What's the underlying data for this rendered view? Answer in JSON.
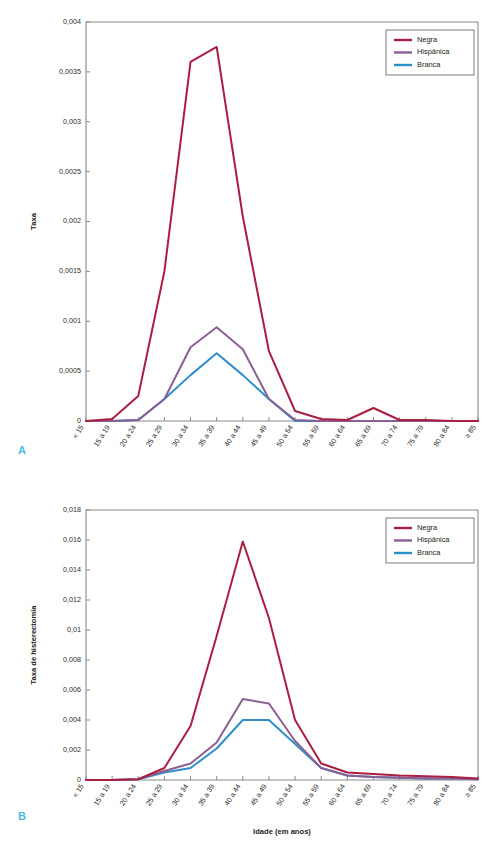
{
  "figure": {
    "panels": [
      {
        "letter": "A",
        "xlabel": "Idade (em anos)",
        "ylabel": "Taxa"
      },
      {
        "letter": "B",
        "xlabel": "Idade (em anos)",
        "ylabel": "Taxa de histerectomia"
      }
    ]
  },
  "colors": {
    "negra": "#AA1E40",
    "hispanica": "#8B5E94",
    "branca": "#2F8FCC",
    "axis": "#8a8a8a",
    "panel_letter": "#4FB8E8",
    "text": "#1e1e1e",
    "legend_border": "#6e6e6e",
    "background": "#ffffff"
  },
  "legend": {
    "position": "top-right",
    "entries": [
      {
        "label": "Negra",
        "color": "#AA1E40"
      },
      {
        "label": "Hispânica",
        "color": "#8B5E94"
      },
      {
        "label": "Branca",
        "color": "#2F8FCC"
      }
    ]
  },
  "chart_data": [
    {
      "type": "line",
      "panel": "A",
      "title": "",
      "xlabel": "Idade (em anos)",
      "ylabel": "Taxa",
      "grid": false,
      "legend_position": "top-right",
      "ylim": [
        0,
        0.004
      ],
      "ytick_labels": [
        "0",
        "0,0005",
        "0,001",
        "0,0015",
        "0,002",
        "0,0025",
        "0,003",
        "0,0035",
        "0,004"
      ],
      "ytick_values": [
        0,
        0.0005,
        0.001,
        0.0015,
        0.002,
        0.0025,
        0.003,
        0.0035,
        0.004
      ],
      "categories": [
        "< 15",
        "15 a 19",
        "20 a 24",
        "25 a 29",
        "30 a 34",
        "35 a 39",
        "40 a 44",
        "45 a 49",
        "50 a 54",
        "55 a 59",
        "60 a 64",
        "65 a 69",
        "70 a 74",
        "75 a 79",
        "80 a 84",
        "≥ 85"
      ],
      "series": [
        {
          "name": "Negra",
          "color": "#AA1E40",
          "values": [
            0,
            2e-05,
            0.00025,
            0.0015,
            0.0036,
            0.00375,
            0.00205,
            0.0007,
            0.0001,
            2e-05,
            1e-05,
            0.00013,
            1e-05,
            1e-05,
            0,
            0
          ]
        },
        {
          "name": "Hispânica",
          "color": "#8B5E94",
          "values": [
            0,
            0,
            1e-05,
            0.00022,
            0.00074,
            0.00094,
            0.00072,
            0.00022,
            1e-05,
            0,
            0,
            0,
            0,
            0,
            0,
            0
          ]
        },
        {
          "name": "Branca",
          "color": "#2F8FCC",
          "values": [
            0,
            0,
            1e-05,
            0.00022,
            0.00046,
            0.00068,
            0.00046,
            0.00022,
            0,
            0,
            0,
            0,
            0,
            0,
            0,
            0
          ]
        }
      ]
    },
    {
      "type": "line",
      "panel": "B",
      "title": "",
      "xlabel": "Idade (em anos)",
      "ylabel": "Taxa de histerectomia",
      "grid": false,
      "legend_position": "top-right",
      "ylim": [
        0,
        0.018
      ],
      "ytick_labels": [
        "0",
        "0,002",
        "0,004",
        "0,006",
        "0,008",
        "0,01",
        "0,012",
        "0,014",
        "0,016",
        "0,018"
      ],
      "ytick_values": [
        0,
        0.002,
        0.004,
        0.006,
        0.008,
        0.01,
        0.012,
        0.014,
        0.016,
        0.018
      ],
      "categories": [
        "< 15",
        "15 a 19",
        "20 a 24",
        "25 a 29",
        "30 a 34",
        "35 a 39",
        "40 a 44",
        "45 a 49",
        "50 a 54",
        "55 a 59",
        "60 a 64",
        "65 a 69",
        "70 a 74",
        "75 a 79",
        "80 a 84",
        "≥ 85"
      ],
      "series": [
        {
          "name": "Negra",
          "color": "#AA1E40",
          "values": [
            0,
            0,
            5e-05,
            0.0008,
            0.0036,
            0.0096,
            0.0159,
            0.0108,
            0.004,
            0.0011,
            0.0005,
            0.0004,
            0.0003,
            0.00025,
            0.0002,
            0.0001
          ]
        },
        {
          "name": "Hispânica",
          "color": "#8B5E94",
          "values": [
            0,
            0,
            5e-05,
            0.0006,
            0.0011,
            0.0025,
            0.0054,
            0.0051,
            0.0026,
            0.0008,
            0.0003,
            0.0002,
            0.00015,
            0.0001,
            0.0001,
            5e-05
          ]
        },
        {
          "name": "Branca",
          "color": "#2F8FCC",
          "values": [
            0,
            0,
            5e-05,
            0.0005,
            0.0008,
            0.0021,
            0.004,
            0.004,
            0.0024,
            0.0008,
            0.0003,
            0.0002,
            0.00015,
            0.0001,
            0.0001,
            5e-05
          ]
        }
      ]
    }
  ]
}
